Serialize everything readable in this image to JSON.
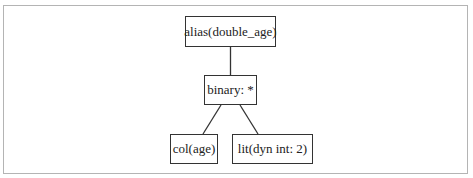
{
  "diagram": {
    "type": "expression-tree",
    "nodes": [
      {
        "id": "alias",
        "label": "alias(double_age)",
        "x": 185,
        "y": 16,
        "w": 91,
        "h": 31
      },
      {
        "id": "binary",
        "label": "binary: *",
        "x": 204,
        "y": 75,
        "w": 53,
        "h": 30
      },
      {
        "id": "col",
        "label": "col(age)",
        "x": 170,
        "y": 134,
        "w": 48,
        "h": 30
      },
      {
        "id": "lit",
        "label": "lit(dyn int: 2)",
        "x": 232,
        "y": 134,
        "w": 81,
        "h": 30
      }
    ],
    "edges": [
      {
        "from": "alias",
        "to": "binary"
      },
      {
        "from": "binary",
        "to": "col"
      },
      {
        "from": "binary",
        "to": "lit"
      }
    ],
    "colors": {
      "border": "#333333",
      "frame": "#b4b4b4",
      "text": "#222222"
    }
  }
}
